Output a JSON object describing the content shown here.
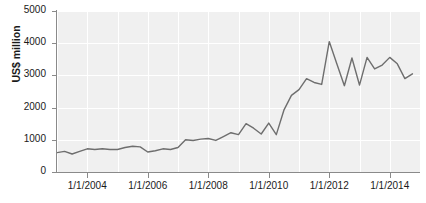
{
  "chart_data": {
    "type": "line",
    "title": "",
    "xlabel": "",
    "ylabel": "US$ million",
    "ylim": [
      0,
      5000
    ],
    "ytick_labels": [
      "0",
      "1000",
      "2000",
      "3000",
      "4000",
      "5000"
    ],
    "ytick_values": [
      0,
      1000,
      2000,
      3000,
      4000,
      5000
    ],
    "xtick_labels": [
      "1/1/2004",
      "1/1/2006",
      "1/1/2008",
      "1/1/2010",
      "1/1/2012",
      "1/1/2014"
    ],
    "xtick_values": [
      2004.0,
      2006.0,
      2008.0,
      2010.0,
      2012.0,
      2014.0
    ],
    "xlim": [
      2003.0,
      2015.0
    ],
    "grid": true,
    "legend": false,
    "line_color": "#6e6e6e",
    "plot_background": "#f0f0f0",
    "gridline_color": "#ffffff",
    "axis_color": "#8a8a8a",
    "series": [
      {
        "name": "US$ million",
        "x": [
          2003.0,
          2003.25,
          2003.5,
          2003.75,
          2004.0,
          2004.25,
          2004.5,
          2004.75,
          2005.0,
          2005.25,
          2005.5,
          2005.75,
          2006.0,
          2006.25,
          2006.5,
          2006.75,
          2007.0,
          2007.25,
          2007.5,
          2007.75,
          2008.0,
          2008.25,
          2008.5,
          2008.75,
          2009.0,
          2009.25,
          2009.5,
          2009.75,
          2010.0,
          2010.25,
          2010.5,
          2010.75,
          2011.0,
          2011.25,
          2011.5,
          2011.75,
          2012.0,
          2012.25,
          2012.5,
          2012.75,
          2013.0,
          2013.25,
          2013.5,
          2013.75,
          2014.0,
          2014.25,
          2014.5,
          2014.75
        ],
        "values": [
          600,
          640,
          560,
          640,
          720,
          700,
          720,
          700,
          700,
          760,
          800,
          780,
          620,
          660,
          720,
          700,
          760,
          1000,
          980,
          1020,
          1040,
          980,
          1100,
          1220,
          1160,
          1500,
          1360,
          1180,
          1520,
          1160,
          1920,
          2380,
          2560,
          2900,
          2780,
          2720,
          4050,
          3360,
          2680,
          3540,
          2700,
          3560,
          3200,
          3320,
          3560,
          3360,
          2900,
          3050
        ]
      }
    ]
  }
}
